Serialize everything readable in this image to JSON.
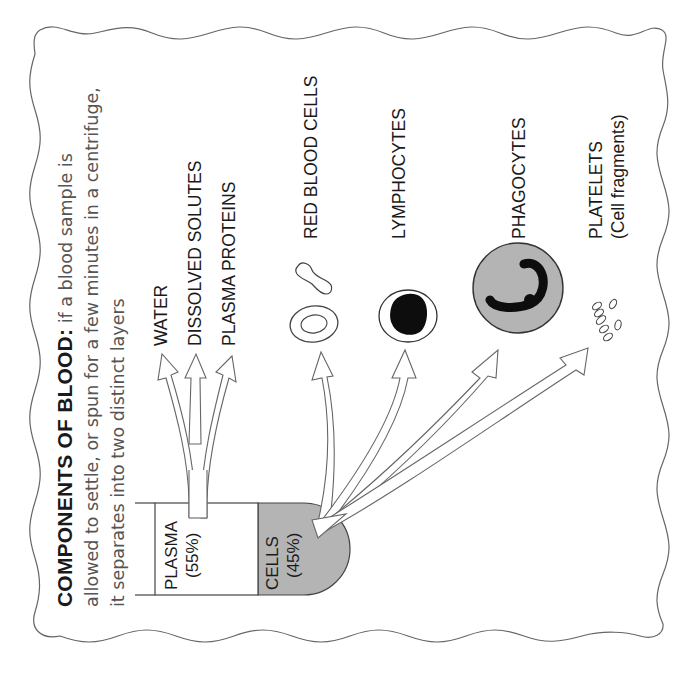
{
  "title": {
    "heading": "COMPONENTS OF BLOOD:",
    "line1_rest": " if a blood sample is",
    "line2": "allowed to settle, or spun for a few minutes in a centrifuge,",
    "line3": "it separates into two distinct layers"
  },
  "tube": {
    "plasma": {
      "label": "PLASMA",
      "percent": "(55%)"
    },
    "cells": {
      "label": "CELLS",
      "percent": "(45%)"
    }
  },
  "plasma_components": [
    {
      "label": "WATER"
    },
    {
      "label": "DISSOLVED SOLUTES"
    },
    {
      "label": "PLASMA PROTEINS"
    }
  ],
  "cell_components": [
    {
      "label": "RED BLOOD CELLS",
      "icon": "red-blood-cell-icon"
    },
    {
      "label": "LYMPHOCYTES",
      "icon": "lymphocyte-icon"
    },
    {
      "label": "PHAGOCYTES",
      "icon": "phagocyte-icon"
    },
    {
      "label": "PLATELETS",
      "sublabel": "(Cell fragments)",
      "icon": "platelets-icon"
    }
  ],
  "colors": {
    "line": "#555555",
    "cells_fill": "#b4b4b4",
    "nucleus": "#111111",
    "background": "#ffffff"
  }
}
